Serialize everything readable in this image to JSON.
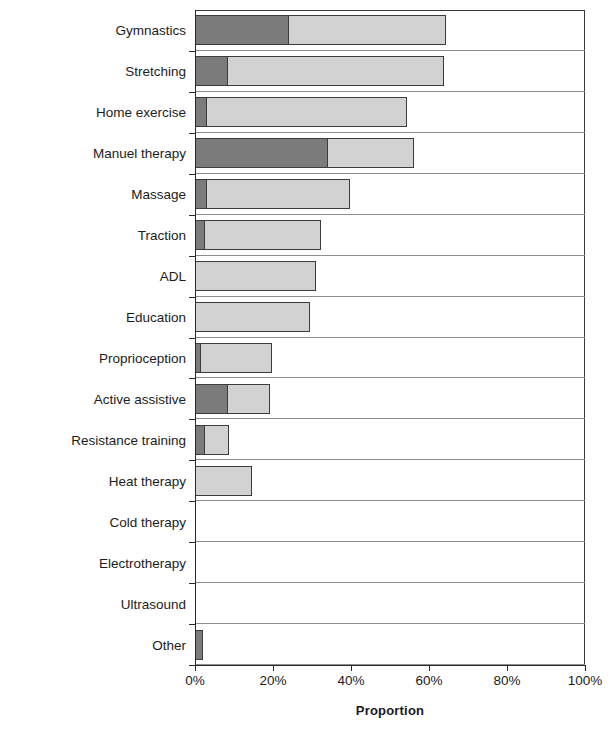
{
  "chart_data": {
    "type": "bar",
    "orientation": "horizontal",
    "stacked": true,
    "title": "",
    "xlabel": "Proportion",
    "ylabel": "Treatment",
    "xlim": [
      0,
      100
    ],
    "xticks": [
      "0%",
      "20%",
      "40%",
      "60%",
      "80%",
      "100%"
    ],
    "xtick_values": [
      0,
      20,
      40,
      60,
      80,
      100
    ],
    "grid": false,
    "legend": "none",
    "categories": [
      "Gymnastics",
      "Stretching",
      "Home exercise",
      "Manuel therapy",
      "Massage",
      "Traction",
      "ADL",
      "Education",
      "Proprioception",
      "Active assistive",
      "Resistance training",
      "Heat therapy",
      "Cold therapy",
      "Electrotherapy",
      "Ultrasound",
      "Other"
    ],
    "series": [
      {
        "name": "dark",
        "color": "#7b7b7b",
        "values": [
          24.0,
          8.5,
          3.0,
          34.0,
          3.0,
          2.5,
          0.0,
          0.0,
          1.5,
          8.5,
          2.5,
          0.0,
          0.0,
          0.0,
          0.0,
          2.0
        ]
      },
      {
        "name": "light",
        "color": "#d2d2d2",
        "values": [
          40.5,
          55.5,
          51.5,
          22.5,
          37.0,
          30.0,
          31.0,
          29.5,
          18.5,
          11.0,
          6.5,
          14.5,
          0.0,
          0.0,
          0.0,
          0.0
        ]
      }
    ],
    "totals": [
      64.5,
      64.0,
      54.5,
      56.5,
      40.0,
      32.5,
      31.0,
      29.5,
      20.0,
      19.5,
      9.0,
      14.5,
      0.0,
      0.0,
      0.0,
      2.0
    ]
  }
}
